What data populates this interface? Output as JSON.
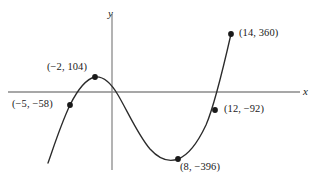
{
  "figure": {
    "background_color": "#ffffff",
    "curve_color": "#2b2b2b",
    "axis_color": "#8a8a8a",
    "point_color": "#1a1a1a",
    "width": 318,
    "height": 181
  },
  "axes": {
    "x_label": "x",
    "y_label": "y",
    "x_label_pos": {
      "left": 303,
      "top": 86
    },
    "y_label_pos": {
      "left": 108,
      "top": 8
    },
    "origin": {
      "x": 112,
      "y": 92
    },
    "x_axis_extent": {
      "x1": 8,
      "x2": 300
    },
    "y_axis_extent": {
      "y1": 14,
      "y2": 170
    }
  },
  "chart_data": {
    "type": "line",
    "title": "",
    "xlabel": "x",
    "ylabel": "y",
    "grid": false,
    "legend": null,
    "xlim": [
      -7,
      16
    ],
    "ylim": [
      -460,
      430
    ],
    "labeled_points": [
      {
        "label": "(−5, −58)",
        "x": -5,
        "y": -58,
        "px": 70,
        "py": 105,
        "label_left": 12,
        "label_top": 99
      },
      {
        "label": "(−2, 104)",
        "x": -2,
        "y": 104,
        "px": 95,
        "py": 77,
        "label_left": 47,
        "label_top": 62
      },
      {
        "label": "(8, −396)",
        "x": 8,
        "y": -396,
        "px": 178,
        "py": 159,
        "label_left": 180,
        "label_top": 162
      },
      {
        "label": "(12, −92)",
        "x": 12,
        "y": -92,
        "px": 215,
        "py": 110,
        "label_left": 224,
        "label_top": 104
      },
      {
        "label": "(14, 360)",
        "x": 14,
        "y": 360,
        "px": 231,
        "py": 34,
        "label_left": 239,
        "label_top": 28
      }
    ],
    "curve_path": "M 48,163 C 54,146 61,124 70,105 C 78,89 86,79 95,77 C 104,76 111,83 118,95 C 128,112 138,135 150,149 C 160,160 170,162 178,159 C 189,155 198,142 206,125 C 213,109 221,78 231,34"
  }
}
